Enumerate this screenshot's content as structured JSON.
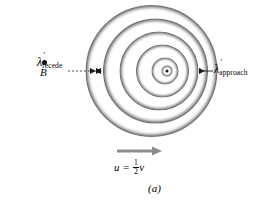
{
  "figure": {
    "caption": "(a)",
    "background_color": "#ffffff",
    "ink_color": "#000000",
    "arrow_color": "#8c8c8c"
  },
  "observer": {
    "label": "B",
    "dot_name": "observer-point-dot",
    "x": 44,
    "y": 62
  },
  "labels": {
    "recede": {
      "symbol": "λ",
      "prime": "′",
      "subscript": "recede",
      "side": "left"
    },
    "approach": {
      "symbol": "λ",
      "prime": "′",
      "subscript": "approach",
      "side": "right"
    }
  },
  "motion": {
    "variable": "u",
    "equals": "=",
    "numerator": "1",
    "denominator": "2",
    "speed_symbol": "v",
    "full_text": "u = 1/2 v",
    "arrow_direction": "right",
    "arrow_color": "#8c8c8c"
  },
  "wavefronts": {
    "source_dot": {
      "cx": 167,
      "cy": 71,
      "r": 1.6
    },
    "description": "Concentric circular wavefronts emitted by a source moving to the right; centers progressively offset rightward so fronts bunch on the approach (right) side and spread on the recede (left) side.",
    "circles": [
      {
        "cx": 151.5,
        "cy": 71,
        "r": 66.0,
        "band": 5.5
      },
      {
        "cx": 155.5,
        "cy": 71,
        "r": 52.5,
        "band": 5.0
      },
      {
        "cx": 159.0,
        "cy": 71,
        "r": 39.5,
        "band": 4.6
      },
      {
        "cx": 162.5,
        "cy": 71,
        "r": 26.5,
        "band": 4.2
      },
      {
        "cx": 165.0,
        "cy": 71,
        "r": 13.5,
        "band": 3.8
      },
      {
        "cx": 167.0,
        "cy": 71,
        "r": 5.5,
        "band": 3.2
      }
    ],
    "shade_dark": "#6f6f6f",
    "shade_light": "#ffffff"
  },
  "annotations": {
    "recede_marker": {
      "x1": 62,
      "y1": 71,
      "x2": 92,
      "y2": 71,
      "style": "dashed-with-arrowheads"
    },
    "approach_marker": {
      "x1": 212,
      "y1": 71,
      "x2": 198,
      "y2": 71,
      "style": "line-with-left-arrowhead"
    },
    "motion_arrow": {
      "x1": 117,
      "y1": 151,
      "x2": 160,
      "y2": 151
    }
  }
}
